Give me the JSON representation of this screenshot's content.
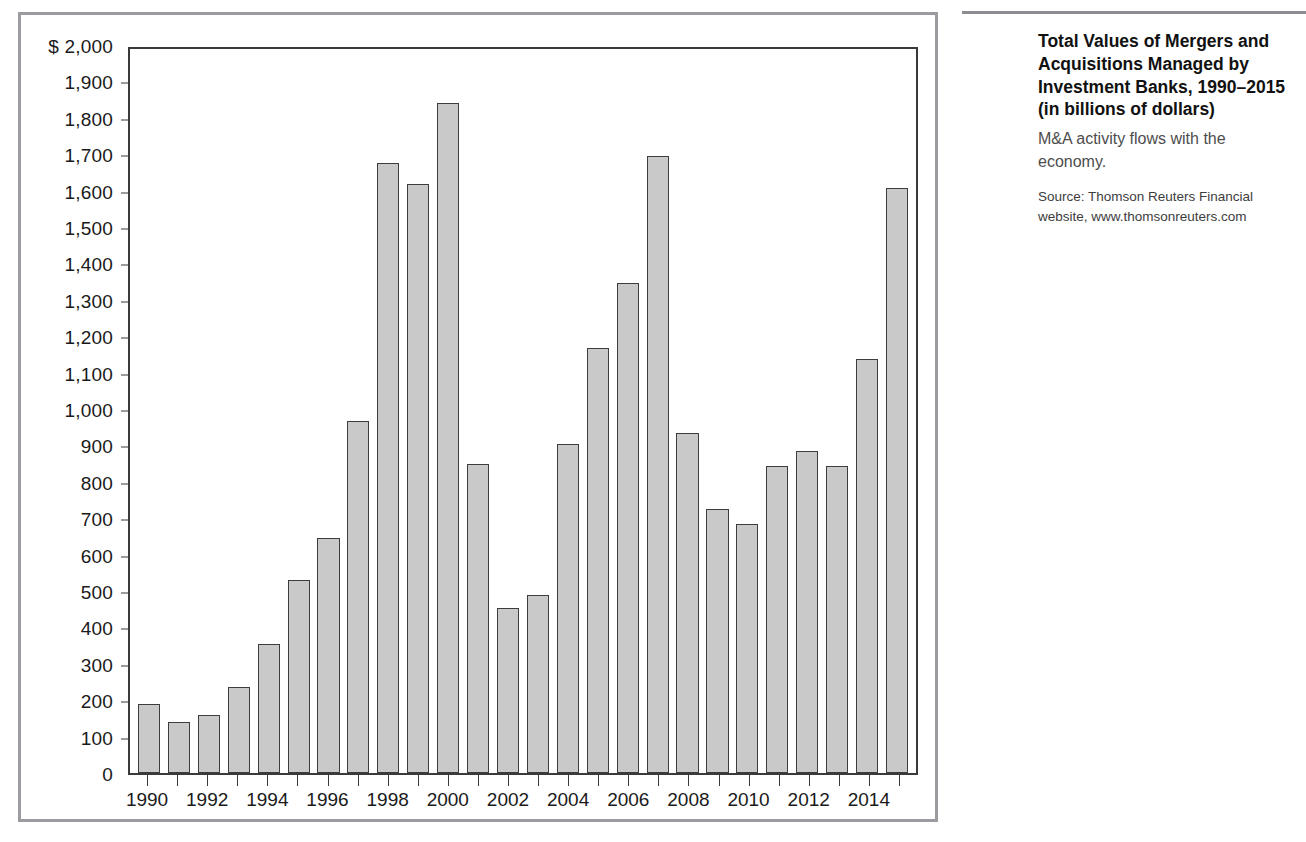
{
  "figure": {
    "rule_visible": true
  },
  "caption": {
    "title": "Total Values of Mergers and Acquisitions Managed by Investment Banks, 1990–2015",
    "subtitle": "(in billions of dollars)",
    "description": "M&A activity flows with the economy.",
    "source": "Source: Thomson Reuters Financial website, www.thomsonreuters.com"
  },
  "chart_data": {
    "type": "bar",
    "title": "Total Values of Mergers and Acquisitions Managed by Investment Banks, 1990–2015",
    "subtitle": "(in billions of dollars)",
    "xlabel": "",
    "ylabel": "",
    "ylim": [
      0,
      2000
    ],
    "ytick_step": 100,
    "grid": false,
    "legend": null,
    "y_axis_prefix": "$",
    "ytick_labels": [
      "$ 2,000",
      "1,900",
      "1,800",
      "1,700",
      "1,600",
      "1,500",
      "1,400",
      "1,300",
      "1,200",
      "1,100",
      "1,000",
      "900",
      "800",
      "700",
      "600",
      "500",
      "400",
      "300",
      "200",
      "100",
      "0"
    ],
    "ytick_values": [
      2000,
      1900,
      1800,
      1700,
      1600,
      1500,
      1400,
      1300,
      1200,
      1100,
      1000,
      900,
      800,
      700,
      600,
      500,
      400,
      300,
      200,
      100,
      0
    ],
    "categories": [
      "1990",
      "1991",
      "1992",
      "1993",
      "1994",
      "1995",
      "1996",
      "1997",
      "1998",
      "1999",
      "2000",
      "2001",
      "2002",
      "2003",
      "2004",
      "2005",
      "2006",
      "2007",
      "2008",
      "2009",
      "2010",
      "2011",
      "2012",
      "2013",
      "2014",
      "2015"
    ],
    "xtick_labels_shown": [
      "1990",
      "1992",
      "1994",
      "1996",
      "1998",
      "2000",
      "2002",
      "2004",
      "2006",
      "2008",
      "2010",
      "2012",
      "2014"
    ],
    "values": [
      190,
      140,
      160,
      238,
      357,
      533,
      648,
      972,
      1685,
      1628,
      1850,
      853,
      455,
      493,
      910,
      1175,
      1355,
      1705,
      938,
      728,
      688,
      848,
      890,
      848,
      1143,
      1615
    ],
    "bar_fill_color": "#c9c9c9",
    "bar_edge_color": "#3d3d3d"
  }
}
